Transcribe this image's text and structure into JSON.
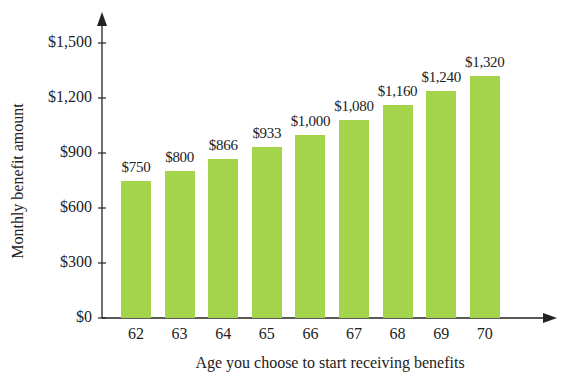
{
  "chart_data": {
    "type": "bar",
    "title": "",
    "categories": [
      "62",
      "63",
      "64",
      "65",
      "66",
      "67",
      "68",
      "69",
      "70"
    ],
    "values": [
      750,
      800,
      866,
      933,
      1000,
      1080,
      1160,
      1240,
      1320
    ],
    "value_labels": [
      "$750",
      "$800",
      "$866",
      "$933",
      "$1,000",
      "$1,080",
      "$1,160",
      "$1,240",
      "$1,320"
    ],
    "xlabel": "Age you choose to start receiving benefits",
    "ylabel": "Monthly benefit amount",
    "ylim": [
      0,
      1500
    ],
    "yticks": [
      0,
      300,
      600,
      900,
      1200,
      1500
    ],
    "ytick_labels": [
      "$0",
      "$300",
      "$600",
      "$900",
      "$1,200",
      "$1,500"
    ],
    "grid": false,
    "legend": null,
    "bar_color": "#a3d44b"
  }
}
